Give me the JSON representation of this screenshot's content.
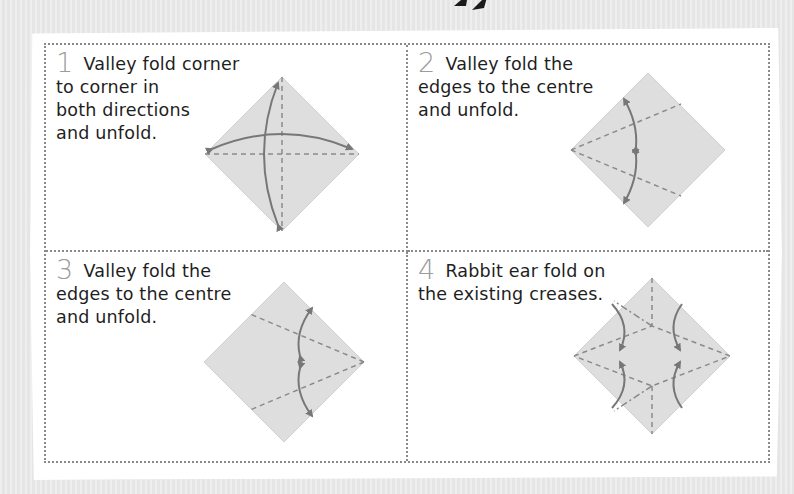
{
  "page": {
    "background_color": "#ececec",
    "paper_color": "#ffffff",
    "border_color": "#8a8a8a",
    "number_color": "#9b9b9b",
    "text_color": "#1e1e1e",
    "diagram_fill": "#dedede",
    "crease_color": "#8a8a8a",
    "arrow_color": "#777777"
  },
  "steps": [
    {
      "number": "1",
      "lines": [
        "Valley fold corner",
        "to corner in",
        "both directions",
        "and unfold."
      ],
      "diagram": "diamond-with-both-diagonal-creases-and-two-curved-double-arrows"
    },
    {
      "number": "2",
      "lines": [
        "Valley fold the",
        "edges to the centre",
        "and unfold."
      ],
      "diagram": "diamond-with-two-creases-from-left-corner-and-curved-arrows"
    },
    {
      "number": "3",
      "lines": [
        "Valley fold the",
        "edges to the centre",
        "and unfold."
      ],
      "diagram": "diamond-with-two-creases-from-right-corner-and-curved-arrows"
    },
    {
      "number": "4",
      "lines": [
        "Rabbit ear fold on",
        "the existing creases."
      ],
      "diagram": "diamond-with-rabbit-ear-creases-and-four-curved-arrows"
    }
  ]
}
